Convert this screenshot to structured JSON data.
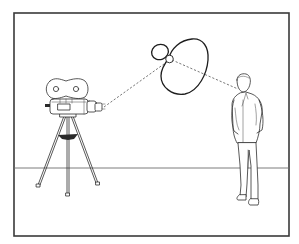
{
  "figure": {
    "colors": {
      "background": "#ffffff",
      "frame": "#3a3a3a",
      "ink": "#2e2e2e",
      "horizon": "#6e6e6e"
    },
    "elements": {
      "frame": "rectangular-border",
      "horizon": "floor-horizon-line",
      "camera": "film-camera-icon",
      "tripod": "tripod-icon",
      "polar_pattern": "microphone-polar-pattern-icon",
      "subject": "standing-person-icon",
      "sight_lines": "dashed-lines"
    }
  }
}
